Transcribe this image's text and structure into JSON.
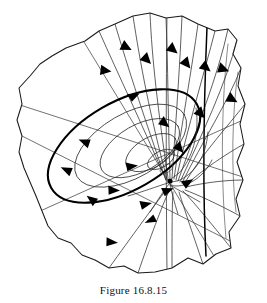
{
  "figure": {
    "caption": "Figure 16.8.15",
    "background_color": "#ffffff",
    "ink_color": "#000000"
  },
  "diagram": {
    "type": "phase-portrait",
    "equilibrium": {
      "name": "focus",
      "cx": 170,
      "cy": 181,
      "stability": "stable-spiral"
    },
    "limit_cycle": {
      "name": "limit-cycle",
      "cx": 124,
      "cy": 146,
      "rx": 84,
      "ry": 44,
      "rotation_deg": -30,
      "stroke_width": 2.1
    },
    "inner_spirals": [
      {
        "rx": 62,
        "ry": 32,
        "rotation_deg": -30
      },
      {
        "rx": 44,
        "ry": 23,
        "rotation_deg": -30
      },
      {
        "rx": 28,
        "ry": 15,
        "rotation_deg": -30
      },
      {
        "rx": 15,
        "ry": 8,
        "rotation_deg": -30
      }
    ],
    "region_boundary": {
      "name": "region-outline",
      "points": "85,41 99,31 115,24 133,16 150,13 166,18 182,16 198,24 215,31 228,29 237,40 233,54 241,68 238,86 245,104 240,124 244,144 237,162 243,180 236,199 240,216 229,232 231,248 216,254 203,264 188,258 172,268 155,272 138,273 124,266 109,268 95,260 82,255 71,243 58,238 48,226 42,211 36,196 30,182 24,168 19,152 22,136 17,120 22,104 19,88 30,76 40,64 52,56 66,48"
    },
    "arrow_count": 22,
    "trajectory_count": 26
  }
}
